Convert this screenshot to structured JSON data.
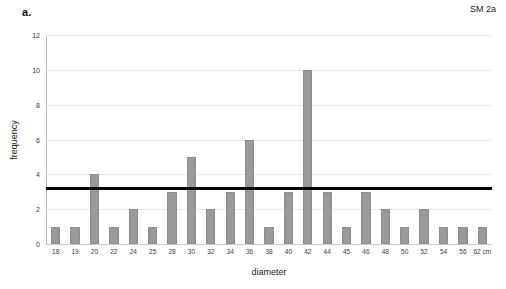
{
  "panel": {
    "label": "a."
  },
  "chart_data": {
    "type": "bar",
    "title": "",
    "subtitle": "",
    "xlabel": "diameter",
    "ylabel": "frequency",
    "categories": [
      "18",
      "19",
      "20",
      "22",
      "24",
      "25",
      "28",
      "30",
      "32",
      "34",
      "36",
      "38",
      "40",
      "42",
      "44",
      "45",
      "46",
      "48",
      "50",
      "52",
      "54",
      "56",
      "62 cm"
    ],
    "values": [
      1,
      1,
      4,
      1,
      2,
      1,
      3,
      5,
      2,
      3,
      6,
      1,
      3,
      10,
      3,
      1,
      3,
      2,
      1,
      2,
      1,
      1,
      1
    ],
    "series": [
      {
        "name": "SM 2a",
        "values": [
          1,
          1,
          4,
          1,
          2,
          1,
          3,
          5,
          2,
          3,
          6,
          1,
          3,
          10,
          3,
          1,
          3,
          2,
          1,
          2,
          1,
          1,
          1
        ]
      }
    ],
    "ylim": [
      0,
      12
    ],
    "yticks": [
      "0",
      "2",
      "4",
      "6",
      "8",
      "10",
      "12"
    ],
    "ytick_values": [
      0,
      2,
      4,
      6,
      8,
      10,
      12
    ],
    "grid": true,
    "grid_axis": "y",
    "legend_position": "top-right",
    "annotations": [
      {
        "name": "series-label",
        "text": "SM 2a"
      }
    ],
    "reference_line": {
      "orientation": "horizontal",
      "value": 3.2,
      "color": "#000000"
    },
    "bar_color": "#9a9a9a",
    "xunit": "cm"
  }
}
